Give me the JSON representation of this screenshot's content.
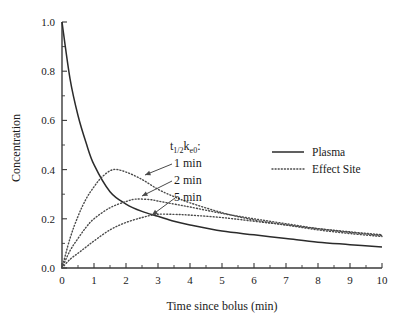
{
  "chart_data": {
    "type": "line",
    "title": "",
    "xlabel": "Time since bolus (min)",
    "ylabel": "Concentration",
    "xlim": [
      0,
      10
    ],
    "ylim": [
      0.0,
      1.0
    ],
    "grid": false,
    "x_ticks": [
      "0",
      "1",
      "2",
      "3",
      "4",
      "5",
      "6",
      "7",
      "8",
      "9",
      "10"
    ],
    "y_ticks": [
      "0.0",
      "0.2",
      "0.4",
      "0.6",
      "0.8",
      "1.0"
    ],
    "x_minor_interval": 0.5,
    "y_minor_interval": 0.1,
    "legend": {
      "position": "right",
      "entries": [
        {
          "label": "Plasma",
          "style": "solid"
        },
        {
          "label": "Effect Site",
          "style": "dotted"
        }
      ]
    },
    "annotation": {
      "header_main": "t",
      "header_sub1": "1/2",
      "header_k": "k",
      "header_sub2": "e0",
      "header_colon": ":",
      "header_plain": "t1/2ke0:",
      "items": [
        "1 min",
        "2 min",
        "5 min"
      ]
    },
    "series": [
      {
        "name": "Plasma",
        "style": "solid",
        "model": "biexponential bolus decay",
        "params": {
          "A": 0.72,
          "alpha": 1.45,
          "B": 0.28,
          "beta": 0.122
        },
        "points": [
          {
            "x": 0.0,
            "y": 1.0
          },
          {
            "x": 0.25,
            "y": 0.77
          },
          {
            "x": 0.5,
            "y": 0.62
          },
          {
            "x": 0.75,
            "y": 0.51
          },
          {
            "x": 1.0,
            "y": 0.42
          },
          {
            "x": 1.5,
            "y": 0.31
          },
          {
            "x": 2.0,
            "y": 0.26
          },
          {
            "x": 2.5,
            "y": 0.23
          },
          {
            "x": 3.0,
            "y": 0.21
          },
          {
            "x": 3.5,
            "y": 0.19
          },
          {
            "x": 4.0,
            "y": 0.175
          },
          {
            "x": 5.0,
            "y": 0.15
          },
          {
            "x": 6.0,
            "y": 0.135
          },
          {
            "x": 7.0,
            "y": 0.12
          },
          {
            "x": 8.0,
            "y": 0.105
          },
          {
            "x": 9.0,
            "y": 0.095
          },
          {
            "x": 10.0,
            "y": 0.085
          }
        ]
      },
      {
        "name": "Effect Site 1 min",
        "style": "dotted",
        "t_half_keo": 1,
        "keo": 0.693,
        "peak": {
          "x": 1.6,
          "y": 0.4
        },
        "points": [
          {
            "x": 0.0,
            "y": 0.0
          },
          {
            "x": 0.25,
            "y": 0.12
          },
          {
            "x": 0.5,
            "y": 0.21
          },
          {
            "x": 0.75,
            "y": 0.28
          },
          {
            "x": 1.0,
            "y": 0.33
          },
          {
            "x": 1.25,
            "y": 0.37
          },
          {
            "x": 1.6,
            "y": 0.4
          },
          {
            "x": 2.0,
            "y": 0.39
          },
          {
            "x": 2.5,
            "y": 0.36
          },
          {
            "x": 3.0,
            "y": 0.32
          },
          {
            "x": 3.5,
            "y": 0.29
          },
          {
            "x": 4.0,
            "y": 0.265
          },
          {
            "x": 5.0,
            "y": 0.225
          },
          {
            "x": 6.0,
            "y": 0.195
          },
          {
            "x": 7.0,
            "y": 0.175
          },
          {
            "x": 8.0,
            "y": 0.155
          },
          {
            "x": 9.0,
            "y": 0.14
          },
          {
            "x": 10.0,
            "y": 0.128
          }
        ]
      },
      {
        "name": "Effect Site 2 min",
        "style": "dotted",
        "t_half_keo": 2,
        "keo": 0.347,
        "peak": {
          "x": 2.3,
          "y": 0.28
        },
        "points": [
          {
            "x": 0.0,
            "y": 0.0
          },
          {
            "x": 0.25,
            "y": 0.07
          },
          {
            "x": 0.5,
            "y": 0.12
          },
          {
            "x": 0.75,
            "y": 0.165
          },
          {
            "x": 1.0,
            "y": 0.2
          },
          {
            "x": 1.5,
            "y": 0.245
          },
          {
            "x": 2.0,
            "y": 0.27
          },
          {
            "x": 2.3,
            "y": 0.28
          },
          {
            "x": 2.75,
            "y": 0.278
          },
          {
            "x": 3.0,
            "y": 0.272
          },
          {
            "x": 3.5,
            "y": 0.26
          },
          {
            "x": 4.0,
            "y": 0.248
          },
          {
            "x": 5.0,
            "y": 0.222
          },
          {
            "x": 6.0,
            "y": 0.2
          },
          {
            "x": 7.0,
            "y": 0.18
          },
          {
            "x": 8.0,
            "y": 0.16
          },
          {
            "x": 9.0,
            "y": 0.145
          },
          {
            "x": 10.0,
            "y": 0.132
          }
        ]
      },
      {
        "name": "Effect Site 5 min",
        "style": "dotted",
        "t_half_keo": 5,
        "keo": 0.139,
        "peak": {
          "x": 2.95,
          "y": 0.218
        },
        "points": [
          {
            "x": 0.0,
            "y": 0.0
          },
          {
            "x": 0.25,
            "y": 0.035
          },
          {
            "x": 0.5,
            "y": 0.06
          },
          {
            "x": 0.75,
            "y": 0.085
          },
          {
            "x": 1.0,
            "y": 0.11
          },
          {
            "x": 1.5,
            "y": 0.155
          },
          {
            "x": 2.0,
            "y": 0.185
          },
          {
            "x": 2.5,
            "y": 0.205
          },
          {
            "x": 2.95,
            "y": 0.218
          },
          {
            "x": 3.5,
            "y": 0.218
          },
          {
            "x": 4.0,
            "y": 0.215
          },
          {
            "x": 5.0,
            "y": 0.205
          },
          {
            "x": 6.0,
            "y": 0.19
          },
          {
            "x": 7.0,
            "y": 0.175
          },
          {
            "x": 8.0,
            "y": 0.16
          },
          {
            "x": 9.0,
            "y": 0.147
          },
          {
            "x": 10.0,
            "y": 0.135
          }
        ]
      }
    ]
  },
  "colors": {
    "background": "#ffffff",
    "axis": "#3a3a3a",
    "plasma": "#2b2b2b",
    "effect_site": "#4a4a4a",
    "text": "#1a1a1a"
  }
}
